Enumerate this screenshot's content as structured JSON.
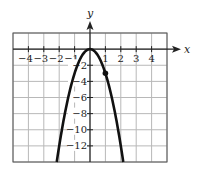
{
  "chart_data": {
    "type": "line",
    "title": "",
    "xlabel": "x",
    "ylabel": "y",
    "xlim": [
      -5,
      5
    ],
    "ylim": [
      -14,
      2
    ],
    "grid": true,
    "x_grid_step": 1,
    "y_grid_step": 2,
    "x_tick_labels": [
      "-4",
      "-3",
      "-2",
      "-1",
      "1",
      "2",
      "3",
      "4"
    ],
    "x_ticks": [
      -4,
      -3,
      -2,
      -1,
      1,
      2,
      3,
      4
    ],
    "y_tick_labels": [
      "-2",
      "-4",
      "-6",
      "-8",
      "-10",
      "-12"
    ],
    "y_ticks": [
      -2,
      -4,
      -6,
      -8,
      -10,
      -12
    ],
    "series": [
      {
        "name": "y = -3x^2",
        "function": "-3*x^2",
        "x": [
          -2.16,
          -2,
          -1.5,
          -1,
          -0.5,
          0,
          0.5,
          1,
          1.5,
          2,
          2.16
        ],
        "values": [
          -14,
          -12,
          -6.75,
          -3,
          -0.75,
          0,
          -0.75,
          -3,
          -6.75,
          -12,
          -14
        ],
        "color": "#111111"
      }
    ],
    "points": [
      {
        "x": 1,
        "y": -3
      }
    ],
    "legend": null
  },
  "colors": {
    "grid": "#b8b8b8",
    "axis": "#222222",
    "curve": "#111111"
  }
}
